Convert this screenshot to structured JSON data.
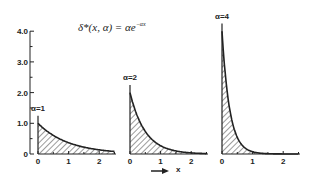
{
  "chart_data": {
    "type": "area",
    "formula": {
      "lhs": "δ*(x, α) = αe",
      "exponent": "−αx"
    },
    "xlabel": "x",
    "ylabel": "",
    "ylim": [
      0,
      4.0
    ],
    "y_ticks": [
      "0",
      "1.0",
      "2.0",
      "3.0",
      "4.0"
    ],
    "x_ticks": [
      "0",
      "1",
      "2"
    ],
    "xlim": [
      0,
      2.5
    ],
    "fill": "hatched",
    "grid": false,
    "panels": [
      {
        "label": "α=1",
        "alpha": 1,
        "x": [
          0,
          0.25,
          0.5,
          0.75,
          1.0,
          1.5,
          2.0,
          2.5
        ],
        "values": [
          1.0,
          0.78,
          0.61,
          0.47,
          0.37,
          0.22,
          0.14,
          0.08
        ]
      },
      {
        "label": "α=2",
        "alpha": 2,
        "x": [
          0,
          0.25,
          0.5,
          0.75,
          1.0,
          1.5,
          2.0,
          2.5
        ],
        "values": [
          2.0,
          1.21,
          0.74,
          0.45,
          0.27,
          0.1,
          0.04,
          0.01
        ]
      },
      {
        "label": "α=4",
        "alpha": 4,
        "x": [
          0,
          0.25,
          0.5,
          0.75,
          1.0,
          1.5,
          2.0,
          2.5
        ],
        "values": [
          4.0,
          1.47,
          0.54,
          0.2,
          0.07,
          0.01,
          0.0,
          0.0
        ]
      }
    ]
  },
  "colors": {
    "ink": "#222222",
    "background": "#ffffff"
  }
}
